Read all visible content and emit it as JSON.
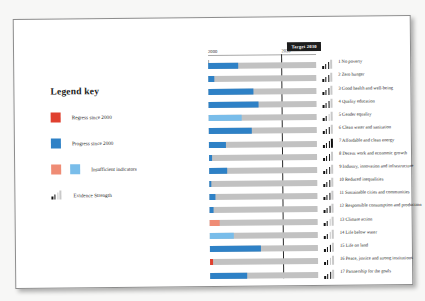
{
  "legend": {
    "title": "Legend key",
    "items": [
      {
        "label": "Regress since 2000",
        "type": "swatch",
        "colors": [
          "#e0402f"
        ]
      },
      {
        "label": "Progress since 2000",
        "type": "swatch",
        "colors": [
          "#2e81c6"
        ]
      },
      {
        "label": "Insufficient indicators",
        "type": "swatch",
        "colors": [
          "#ef8c75",
          "#79bdea"
        ]
      },
      {
        "label": "Evidence Strength",
        "type": "evidence",
        "filled": 2
      }
    ]
  },
  "colors": {
    "regress": "#e0402f",
    "progress": "#2e81c6",
    "insufficient_regress": "#ef8c75",
    "insufficient_progress": "#79bdea",
    "track": "#c2c2c2",
    "target_badge_bg": "#1d1d1d",
    "target_line": "#2b2b2b"
  },
  "chart_data": {
    "type": "bar",
    "title": "",
    "xlabel": "",
    "ylabel": "",
    "orientation": "horizontal",
    "xlim": [
      2000,
      2045
    ],
    "axis_ticks": [
      {
        "label": "2000",
        "value": 2000,
        "pct": 0
      },
      {
        "label": "2020",
        "value": 2020,
        "pct": 68
      }
    ],
    "target_marker": {
      "label": "Target 2030",
      "value": 2030,
      "pct": 68
    },
    "grid": false,
    "legend_position": "left",
    "categories": [
      "1 No poverty",
      "2 Zero hunger",
      "3 Good health and well-being",
      "4 Quality education",
      "5 Gender equality",
      "6 Clean water and sanitation",
      "7 Affordable and clean energy",
      "8 Decent work and economic growth",
      "9 Industry, innovation and infrastructure",
      "10 Reduced inequalities",
      "11 Sustainable cities and communities",
      "12 Responsible consumption and production",
      "13 Climate action",
      "14 Life below water",
      "15 Life on land",
      "16 Peace, justice and strong institutions",
      "17 Partnership for the goals"
    ],
    "values": [
      28,
      6,
      42,
      46,
      31,
      40,
      16,
      3,
      17,
      2,
      6,
      4,
      9,
      22,
      47,
      3,
      34
    ],
    "series": [
      {
        "name": "Progress toward 2030 target",
        "values": [
          28,
          6,
          42,
          46,
          31,
          40,
          16,
          3,
          17,
          2,
          6,
          4,
          9,
          22,
          47,
          3,
          34
        ],
        "fill_types": [
          "progress",
          "progress",
          "progress",
          "progress",
          "insufficient_progress",
          "progress",
          "progress",
          "progress",
          "progress",
          "progress",
          "progress",
          "progress",
          "insufficient_regress",
          "insufficient_progress",
          "progress",
          "regress",
          "progress"
        ]
      }
    ],
    "evidence_strength": [
      3,
      3,
      3,
      3,
      2,
      3,
      4,
      3,
      3,
      3,
      3,
      3,
      2,
      2,
      3,
      2,
      3
    ],
    "evidence_max": 4
  }
}
